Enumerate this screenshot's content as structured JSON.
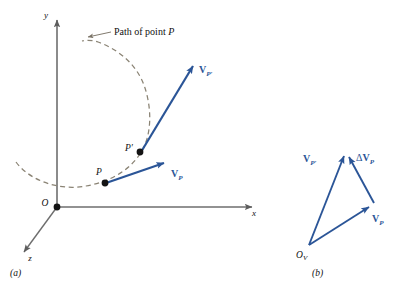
{
  "figure": {
    "panels": [
      {
        "caption": "(a)",
        "caption_x": 10,
        "caption_y": 276,
        "axes": {
          "x_label": "x",
          "y_label": "y",
          "z_label": "z",
          "origin_label": "O",
          "axis_color": "#6e6e6e"
        },
        "path_annotation": {
          "text_plain": "Path of point ",
          "text_italic": "P",
          "full_text": "Path of point P"
        },
        "points": [
          {
            "label": "P",
            "x": 105,
            "y": 183
          },
          {
            "label": "P′",
            "x": 140,
            "y": 152
          }
        ],
        "vectors": [
          {
            "label_main": "V",
            "label_sub": "P",
            "full_label": "V_P"
          },
          {
            "label_main": "V",
            "label_sub": "P′",
            "full_label": "V_P′"
          }
        ]
      },
      {
        "caption": "(b)",
        "caption_x": 312,
        "caption_y": 276,
        "origin_label_main": "O",
        "origin_label_sub": "V",
        "vectors": [
          {
            "label_main": "V",
            "label_sub": "P′",
            "full_label": "V_P′"
          },
          {
            "label_main": "V",
            "label_sub": "P",
            "full_label": "V_P"
          },
          {
            "label_delta": "Δ",
            "label_main": "V",
            "label_sub": "P",
            "full_label": "ΔV_P"
          }
        ]
      }
    ],
    "colors": {
      "vector_blue": "#2b5597",
      "axis_gray": "#6e6e6e",
      "path_dash": "#8a8374",
      "point_black": "#141414",
      "text_black": "#111111",
      "background": "#ffffff"
    }
  }
}
